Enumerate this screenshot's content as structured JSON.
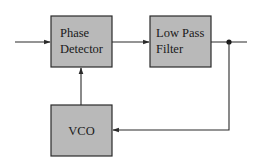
{
  "diagram": {
    "type": "block-diagram",
    "blocks": [
      {
        "id": "phase_detector",
        "lines": [
          "Phase",
          "Detector"
        ]
      },
      {
        "id": "low_pass_filter",
        "lines": [
          "Low Pass",
          "Filter"
        ]
      },
      {
        "id": "vco",
        "lines": [
          "VCO"
        ]
      }
    ],
    "connections": [
      {
        "from": "input",
        "to": "phase_detector"
      },
      {
        "from": "phase_detector",
        "to": "low_pass_filter"
      },
      {
        "from": "low_pass_filter",
        "to": "output"
      },
      {
        "from": "junction",
        "to": "vco"
      },
      {
        "from": "vco",
        "to": "phase_detector"
      }
    ],
    "colors": {
      "block_fill": "#b9b9b9",
      "stroke": "#2a2a2a",
      "background": "#ffffff"
    }
  }
}
